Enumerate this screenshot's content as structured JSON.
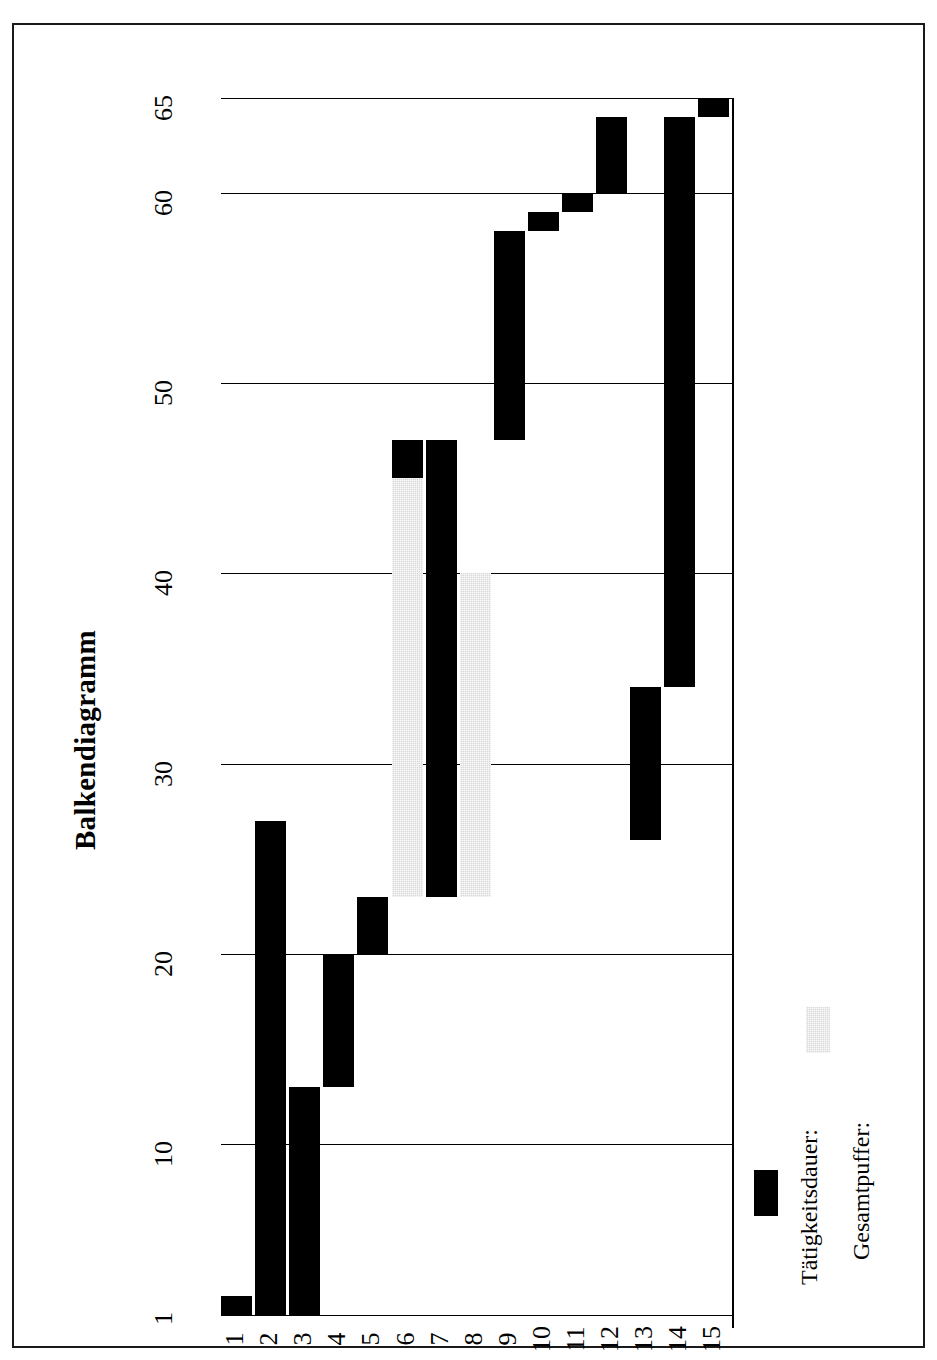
{
  "page": {
    "background_color": "#ffffff",
    "frame_color": "#1a1a1a"
  },
  "chart_data": {
    "type": "bar",
    "title": "Balkendiagramm",
    "orientation": "gantt-rotated-90",
    "xlabel": "",
    "ylabel": "",
    "grid": true,
    "legend_position": "bottom-right",
    "value_axis": {
      "min": 1,
      "max": 65,
      "ticks": [
        1,
        10,
        20,
        30,
        40,
        50,
        60,
        65
      ],
      "tick_labels": [
        "1",
        "10",
        "20",
        "30",
        "40",
        "50",
        "60",
        "65"
      ]
    },
    "category_axis": {
      "categories": [
        "1",
        "2",
        "3",
        "4",
        "5",
        "6",
        "7",
        "8",
        "9",
        "10",
        "11",
        "12",
        "13",
        "14",
        "15"
      ]
    },
    "colors": {
      "duration": "#000000",
      "buffer": "#d9d9d9"
    },
    "series": [
      {
        "name": "Tätigkeitsdauer:",
        "color": "#000000",
        "bars": [
          {
            "category": "1",
            "start": 1,
            "end": 2
          },
          {
            "category": "2",
            "start": 1,
            "end": 27
          },
          {
            "category": "3",
            "start": 1,
            "end": 13
          },
          {
            "category": "4",
            "start": 13,
            "end": 20
          },
          {
            "category": "5",
            "start": 20,
            "end": 23
          },
          {
            "category": "6",
            "start": 45,
            "end": 47
          },
          {
            "category": "7",
            "start": 23,
            "end": 47
          },
          {
            "category": "8",
            "start": 40,
            "end": 40
          },
          {
            "category": "9",
            "start": 47,
            "end": 58
          },
          {
            "category": "10",
            "start": 58,
            "end": 59
          },
          {
            "category": "11",
            "start": 59,
            "end": 60
          },
          {
            "category": "12",
            "start": 60,
            "end": 64
          },
          {
            "category": "13",
            "start": 26,
            "end": 34
          },
          {
            "category": "14",
            "start": 34,
            "end": 64
          },
          {
            "category": "15",
            "start": 64,
            "end": 65
          }
        ]
      },
      {
        "name": "Gesamtpuffer:",
        "color": "#d9d9d9",
        "bars": [
          {
            "category": "6",
            "start": 23,
            "end": 45
          },
          {
            "category": "8",
            "start": 23,
            "end": 40
          }
        ]
      }
    ]
  },
  "legend": {
    "entries": [
      {
        "label": "Tätigkeitsdauer:",
        "swatch": "black"
      },
      {
        "label": "Gesamtpuffer:",
        "swatch": "gray"
      }
    ]
  }
}
